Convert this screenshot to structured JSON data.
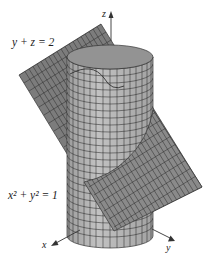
{
  "figure": {
    "plane_label": "y + z = 2",
    "cylinder_label": "x² + y² = 1",
    "axes": {
      "x": "x",
      "y": "y",
      "z": "z"
    },
    "colors": {
      "plane_fill": "#7a7a7a",
      "plane_fill_light": "#9a9a9a",
      "cylinder_fill": "#b4b4b4",
      "cylinder_inner": "#8e8e8e",
      "grid": "#1e1e1e",
      "axis": "#333333"
    }
  }
}
